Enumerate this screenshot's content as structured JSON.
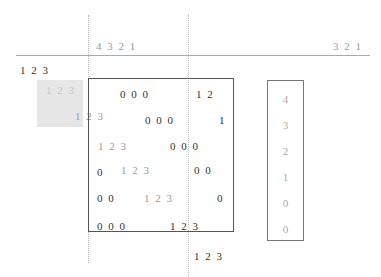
{
  "header": {
    "left_label": "4 3 2 1",
    "right_label": "3 2 1"
  },
  "side_label": "1 2 3",
  "grey_box": {
    "label_top": "1 2 3",
    "label_bottom": "1 2 3"
  },
  "main_box": {
    "rows": [
      {
        "a": "0 0 0",
        "b": "1 2"
      },
      {
        "a": "0 0 0",
        "b": "1"
      },
      {
        "a": "1 2 3",
        "b": "0 0 0"
      },
      {
        "a": "0",
        "b": "1 2 3",
        "c": "0 0"
      },
      {
        "a": "0 0",
        "b": "1 2 3",
        "c": "0"
      },
      {
        "a": "0 0 0",
        "b": "1 2 3"
      }
    ]
  },
  "below_box_label": "1 2 3",
  "column": {
    "items": [
      "4",
      "3",
      "2",
      "1",
      "0",
      "0"
    ]
  }
}
